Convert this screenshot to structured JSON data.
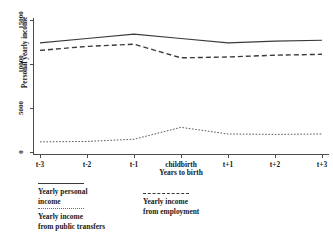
{
  "chart_data": {
    "type": "line",
    "title": "",
    "xlabel": "Years to birth",
    "ylabel": "Personal yearly income",
    "categories": [
      "t-3",
      "t-2",
      "t-1",
      "childbirth",
      "t+1",
      "t+2",
      "t+3"
    ],
    "ylim": [
      0,
      15000
    ],
    "yticks": [
      0,
      5000,
      10000,
      15000
    ],
    "ytick_labels": [
      "0",
      "5000",
      "10000",
      "15000"
    ],
    "grid": false,
    "legend_position": "below-plot",
    "series": [
      {
        "name": "Yearly personal income",
        "style": "solid",
        "values": [
          12400,
          12900,
          13400,
          12900,
          12400,
          12600,
          12700
        ]
      },
      {
        "name": "Yearly income from employment",
        "style": "dashed",
        "values": [
          11550,
          12000,
          12250,
          10700,
          10800,
          11000,
          11100
        ]
      },
      {
        "name": "Yearly income from public transfers",
        "style": "dotted",
        "values": [
          1150,
          1200,
          1450,
          2800,
          2050,
          2000,
          2050
        ]
      }
    ]
  },
  "axis": {
    "y_title": "Personal yearly income",
    "x_title": "Years to birth"
  },
  "legend": {
    "left": [
      {
        "label_line1": "Yearly personal",
        "label_line2": "income",
        "style": "solid"
      },
      {
        "label_line1": "Yearly income",
        "label_line2": "from public transfers",
        "style": "dotted"
      }
    ],
    "right": [
      {
        "label_line1": "Yearly income",
        "label_line2": "from employment",
        "style": "dashed"
      }
    ]
  }
}
